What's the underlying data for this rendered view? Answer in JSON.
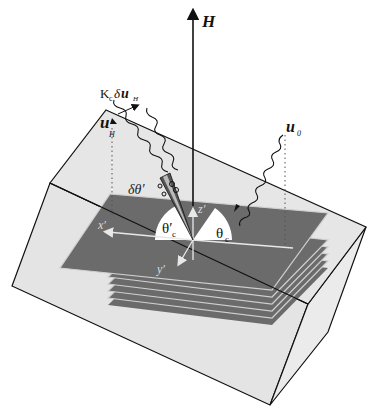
{
  "figure": {
    "type": "3d-schematic",
    "colors": {
      "background": "#ffffff",
      "box_face": "#e4e4e4",
      "layer": "#6b6b6b",
      "layer_gap": "#cfcfcf",
      "outline": "#111111",
      "axis_white": "#e8e8e8"
    }
  },
  "labels": {
    "field": "H",
    "incident_wave": "u",
    "incident_sub": "0",
    "diffracted_wave": "u",
    "diffracted_sub": "H",
    "correction_prefix": "K",
    "correction_prefix_sub": "c",
    "correction_delta": "δ",
    "correction_vec": "u",
    "correction_sub": "H",
    "angle_spread": "δθ′",
    "angle_in": "θ",
    "angle_in_sub": "c",
    "angle_out": "θ′",
    "angle_out_sub": "c",
    "axis_x": "x′",
    "axis_y": "y′",
    "axis_z": "z′"
  },
  "layers": {
    "count": 6
  }
}
